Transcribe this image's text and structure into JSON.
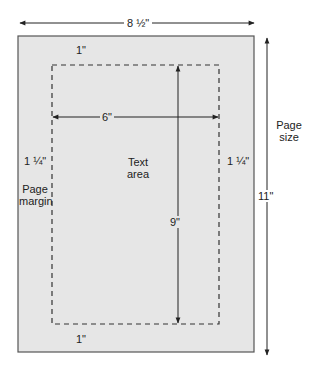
{
  "colors": {
    "page_fill": "#e6e6e6",
    "page_border": "#555555",
    "line": "#222222",
    "background": "#ffffff"
  },
  "labels": {
    "page_width": "8 ½\"",
    "page_height": "11\"",
    "page_size_line1": "Page",
    "page_size_line2": "size",
    "top_margin": "1\"",
    "bottom_margin": "1\"",
    "left_margin": "1 ¼\"",
    "right_margin": "1 ¼\"",
    "page_margin_line1": "Page",
    "page_margin_line2": "margin",
    "text_width": "6\"",
    "text_height": "9\"",
    "text_area_line1": "Text",
    "text_area_line2": "area"
  }
}
